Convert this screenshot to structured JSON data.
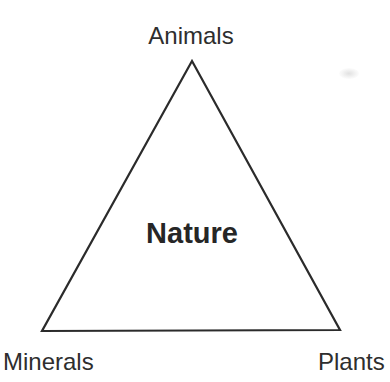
{
  "diagram": {
    "type": "triangle-concept-diagram",
    "center_label": "Nature",
    "vertices": {
      "top": {
        "label": "Animals"
      },
      "bottom_left": {
        "label": "Minerals"
      },
      "bottom_right": {
        "label": "Plants"
      }
    },
    "colors": {
      "line": "#2b2b2b",
      "text": "#2e2e2e",
      "background": "#ffffff"
    }
  }
}
